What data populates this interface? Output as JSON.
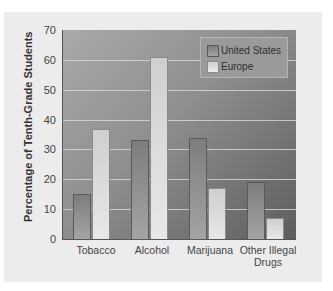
{
  "chart_data": {
    "type": "bar",
    "title": "",
    "xlabel": "",
    "ylabel": "Percentage of Tenth-Grade Students",
    "ylim": [
      0,
      70
    ],
    "yticks": [
      0,
      10,
      20,
      30,
      40,
      50,
      60,
      70
    ],
    "grid": true,
    "legend_position": "top-right",
    "categories": [
      "Tobacco",
      "Alcohol",
      "Marijuana",
      "Other Illegal Drugs"
    ],
    "series": [
      {
        "name": "United States",
        "values": [
          15,
          33,
          34,
          19
        ]
      },
      {
        "name": "Europe",
        "values": [
          37,
          61,
          17,
          7
        ]
      }
    ]
  },
  "axis": {
    "ylabel": "Percentage of Tenth-Grade Students",
    "yticks": [
      "0",
      "10",
      "20",
      "30",
      "40",
      "50",
      "60",
      "70"
    ],
    "xlabels": [
      "Tobacco",
      "Alcohol",
      "Marijuana",
      "Other Illegal Drugs"
    ]
  },
  "legend": {
    "items": [
      {
        "label": "United States"
      },
      {
        "label": "Europe"
      }
    ]
  }
}
